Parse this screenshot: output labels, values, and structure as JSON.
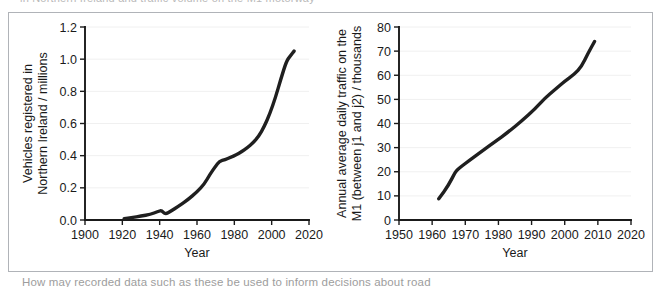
{
  "page": {
    "clipped_text_top": "in Northern Ireland and traffic volume on the M1 motorway",
    "clipped_text_bottom": "How may recorded data such as these be used to inform decisions about road"
  },
  "chart_data": [
    {
      "id": "vehicles-northern-ireland",
      "type": "line",
      "title": "",
      "xlabel": "Year",
      "ylabel": "Vehicles registered in Northern Ireland / millions",
      "ylabel_lines": [
        "Vehicles registered in",
        "Northern Ireland / millions"
      ],
      "xlim": [
        1900,
        2020
      ],
      "ylim": [
        0.0,
        1.2
      ],
      "xticks": [
        1900,
        1920,
        1940,
        1960,
        1980,
        2000,
        2020
      ],
      "xtick_labels": [
        "1900",
        "1920",
        "1940",
        "1960",
        "1980",
        "2000",
        "2020"
      ],
      "yticks": [
        0.0,
        0.2,
        0.4,
        0.6,
        0.8,
        1.0,
        1.2
      ],
      "ytick_labels": [
        "0.0",
        "0.2",
        "0.4",
        "0.6",
        "0.8",
        "1.0",
        "1.2"
      ],
      "grid": true,
      "legend": "none",
      "series": [
        {
          "name": "Vehicles registered",
          "x": [
            1921,
            1925,
            1930,
            1935,
            1939,
            1941,
            1943,
            1946,
            1950,
            1955,
            1960,
            1964,
            1967,
            1970,
            1972,
            1975,
            1978,
            1981,
            1984,
            1987,
            1990,
            1993,
            1996,
            1999,
            2002,
            2005,
            2008,
            2010,
            2012
          ],
          "y": [
            0.008,
            0.015,
            0.024,
            0.035,
            0.052,
            0.06,
            0.035,
            0.055,
            0.085,
            0.125,
            0.175,
            0.225,
            0.285,
            0.335,
            0.365,
            0.375,
            0.39,
            0.405,
            0.425,
            0.45,
            0.48,
            0.52,
            0.58,
            0.66,
            0.76,
            0.88,
            0.99,
            1.02,
            1.05
          ]
        }
      ]
    },
    {
      "id": "m1-daily-traffic",
      "type": "line",
      "title": "",
      "xlabel": "Year",
      "ylabel": "Annual average daily traffic on the M1 (between j1 and j2) / thousands",
      "ylabel_lines": [
        "Annual average daily traffic on  the",
        "M1 (between j1 and j2) / thousands"
      ],
      "xlim": [
        1950,
        2020
      ],
      "ylim": [
        0,
        80
      ],
      "xticks": [
        1950,
        1960,
        1970,
        1980,
        1990,
        2000,
        2010,
        2020
      ],
      "xtick_labels": [
        "1950",
        "1960",
        "1970",
        "1980",
        "1990",
        "2000",
        "2010",
        "2020"
      ],
      "yticks": [
        0,
        10,
        20,
        30,
        40,
        50,
        60,
        70,
        80
      ],
      "ytick_labels": [
        "0",
        "10",
        "20",
        "30",
        "40",
        "50",
        "60",
        "70",
        "80"
      ],
      "grid": true,
      "legend": "none",
      "series": [
        {
          "name": "Annual average daily traffic",
          "x": [
            1962,
            1965,
            1967,
            1968,
            1971,
            1975,
            1979,
            1983,
            1987,
            1991,
            1994,
            1997,
            2000,
            2003,
            2005,
            2007,
            2009
          ],
          "y": [
            8.8,
            14.5,
            20.0,
            21.3,
            24.5,
            28.5,
            32.5,
            36.5,
            41.0,
            46.0,
            50.5,
            54.0,
            57.5,
            60.5,
            63.5,
            69.0,
            74.0
          ]
        }
      ]
    }
  ]
}
